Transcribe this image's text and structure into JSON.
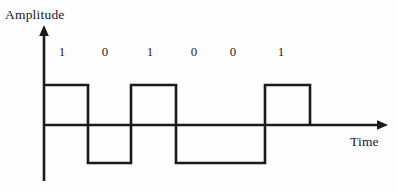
{
  "figure": {
    "background_color": "#fefefe",
    "line_color": "#1a1a1a"
  },
  "axes": {
    "y_axis_title": "Amplitude",
    "x_axis_title": "Time",
    "y_axis_x_px": 44,
    "baseline_y_px": 125,
    "high_level_y_px": 85,
    "low_level_y_px": 163
  },
  "bit_labels": [
    {
      "text": "1",
      "x_px": 62
    },
    {
      "text": "0",
      "x_px": 105
    },
    {
      "text": "1",
      "x_px": 150
    },
    {
      "text": "0",
      "x_px": 194
    },
    {
      "text": "0",
      "x_px": 233
    },
    {
      "text": "1",
      "x_px": 281
    }
  ],
  "chart_data": {
    "type": "line",
    "title": "",
    "subtitle": "",
    "xlabel": "Time",
    "ylabel": "Amplitude",
    "grid": false,
    "legend": false,
    "categories": [
      "1",
      "0",
      "1",
      "0",
      "0",
      "1"
    ],
    "bits": [
      1,
      0,
      1,
      0,
      0,
      1
    ],
    "levels": {
      "high": 1,
      "zero": 0,
      "low": -1
    },
    "ylim": [
      -1,
      1
    ],
    "annotations": [
      "1",
      "0",
      "1",
      "0",
      "0",
      "1"
    ],
    "segments": [
      {
        "bit": "1",
        "level": 1,
        "x_start_px": 44,
        "x_end_px": 88
      },
      {
        "bit": "0",
        "level": -1,
        "x_start_px": 88,
        "x_end_px": 131
      },
      {
        "bit": "1",
        "level": 1,
        "x_start_px": 131,
        "x_end_px": 176
      },
      {
        "bit": "0",
        "level": -1,
        "x_start_px": 176,
        "x_end_px": 221
      },
      {
        "bit": "0",
        "level": -1,
        "x_start_px": 221,
        "x_end_px": 265
      },
      {
        "bit": "1",
        "level": 1,
        "x_start_px": 265,
        "x_end_px": 310
      }
    ],
    "waveform_path": "M 44 85 L 88 85 L 88 163 L 131 163 L 131 85 L 176 85 L 176 163 L 265 163 L 265 85 L 310 85 L 310 125",
    "x": [
      44,
      88,
      88,
      131,
      131,
      176,
      176,
      265,
      265,
      310,
      310
    ],
    "y": [
      1,
      1,
      -1,
      -1,
      1,
      1,
      -1,
      -1,
      1,
      1,
      0
    ]
  }
}
